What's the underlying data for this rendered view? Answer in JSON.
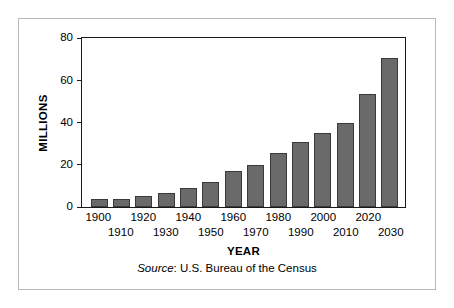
{
  "chart_data": {
    "type": "bar",
    "title": "",
    "xlabel": "YEAR",
    "ylabel": "MILLIONS",
    "ylim": [
      0,
      80
    ],
    "yticks": [
      0,
      20,
      40,
      60,
      80
    ],
    "ytick_labels": [
      "0",
      "20",
      "40",
      "60",
      "80"
    ],
    "grid": false,
    "legend": null,
    "categories": [
      "1900",
      "1910",
      "1920",
      "1930",
      "1940",
      "1950",
      "1960",
      "1970",
      "1980",
      "1990",
      "2000",
      "2010",
      "2020",
      "2030"
    ],
    "values": [
      4,
      4,
      5,
      6.5,
      9,
      12,
      17,
      20,
      25.5,
      31,
      35,
      40,
      53.5,
      70.5
    ],
    "series": [
      {
        "name": "Population 65 and over",
        "values": [
          4,
          4,
          5,
          6.5,
          9,
          12,
          17,
          20,
          25.5,
          31,
          35,
          40,
          53.5,
          70.5
        ]
      }
    ],
    "bar_color": "#6a6a6a",
    "bar_edge_color": "#3a3a3a",
    "axis_color": "#1a1a1a",
    "tick_label_rows": [
      "top",
      "bottom",
      "top",
      "bottom",
      "top",
      "bottom",
      "top",
      "bottom",
      "top",
      "bottom",
      "top",
      "bottom",
      "top",
      "bottom"
    ],
    "annotations": []
  },
  "caption": {
    "source_word": "Source",
    "source_rest": ": U.S. Bureau of the Census"
  },
  "frame": {
    "border_color": "#b9b9b9",
    "background": "#ffffff"
  }
}
